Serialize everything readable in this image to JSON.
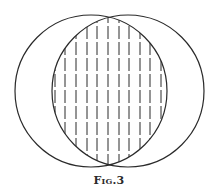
{
  "figure": {
    "caption": "Fig.3",
    "stroke_color": "#2a2a2a",
    "background": "#ffffff",
    "circles": [
      {
        "name": "left-circle",
        "cx": 91,
        "cy": 91,
        "r": 76
      },
      {
        "name": "right-circle",
        "cx": 128,
        "cy": 91,
        "r": 76
      }
    ],
    "hatch": {
      "orientation": "vertical",
      "style": "dashed",
      "x_positions": [
        55,
        65,
        76,
        87,
        97,
        108,
        119,
        129,
        140,
        150,
        161
      ]
    }
  }
}
